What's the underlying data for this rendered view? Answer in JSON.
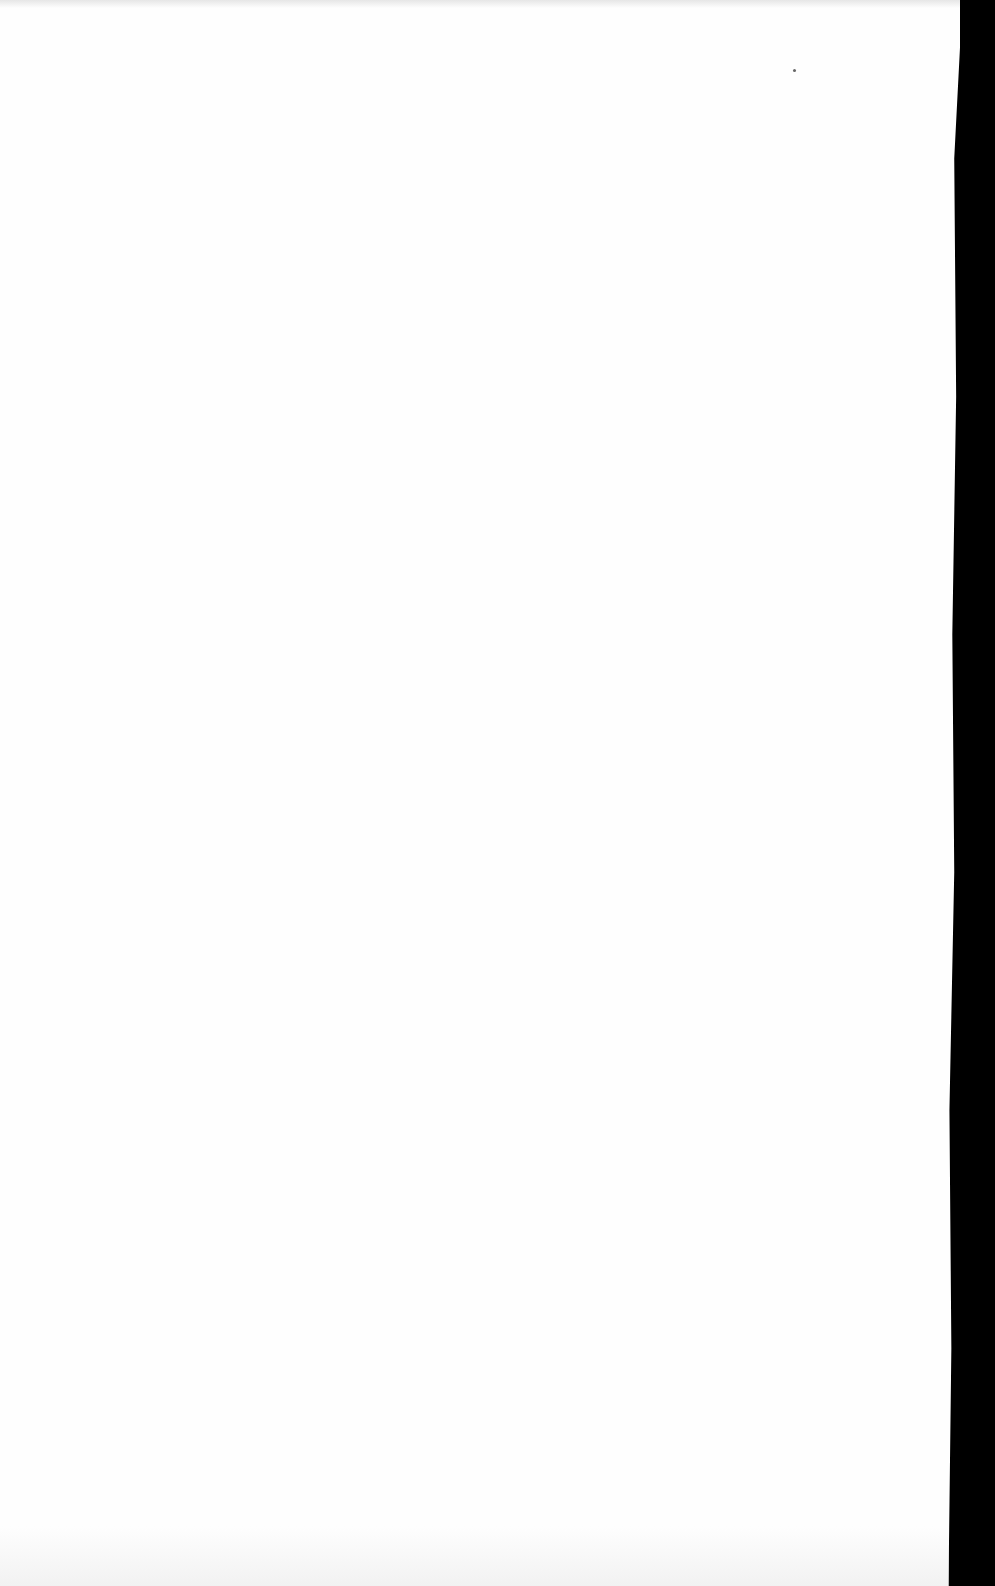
{
  "page": {
    "type": "blank-scanned-page",
    "visible_text": "",
    "colors": {
      "paper": "#fefefe",
      "scan_background": "#000000"
    }
  }
}
